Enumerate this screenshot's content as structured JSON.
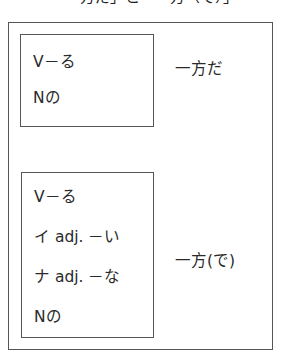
{
  "header": {
    "text": "「一方だ」と「一方（で）」"
  },
  "groups": [
    {
      "forms": [
        "V－る",
        "Nの"
      ],
      "result": "一方だ"
    },
    {
      "forms": [
        "V－る",
        "イ adj. －い",
        "ナ adj. －な",
        "Nの"
      ],
      "result": "一方(で)"
    }
  ],
  "colors": {
    "border": "#555555",
    "text": "#2a2a2a"
  }
}
